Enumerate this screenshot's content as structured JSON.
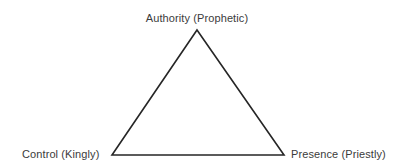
{
  "diagram": {
    "type": "triangle",
    "background_color": "#ffffff",
    "stroke_color": "#262626",
    "stroke_width": 1.6,
    "fill": "none",
    "text_color": "#3b3b3b",
    "vertices": {
      "apex": {
        "x": 197,
        "y": 30
      },
      "bottom_left": {
        "x": 112,
        "y": 155
      },
      "bottom_right": {
        "x": 284,
        "y": 155
      }
    },
    "labels": {
      "apex": "Authority (Prophetic)",
      "bottom_left": "Control (Kingly)",
      "bottom_right": "Presence (Priestly)"
    }
  }
}
